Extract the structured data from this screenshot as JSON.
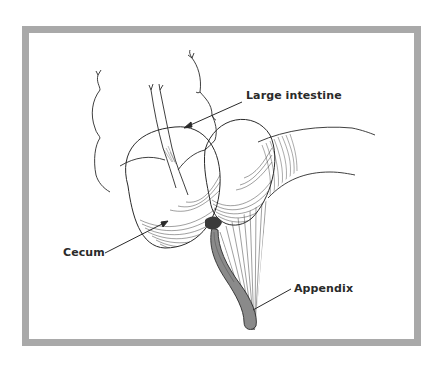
{
  "figure": {
    "labels": {
      "large_intestine": "Large intestine",
      "cecum": "Cecum",
      "appendix": "Appendix"
    },
    "colors": {
      "frame": "#a9a9a9",
      "ink": "#2a2a2a",
      "appendix_fill": "#8a8a8a",
      "background": "#ffffff"
    }
  }
}
